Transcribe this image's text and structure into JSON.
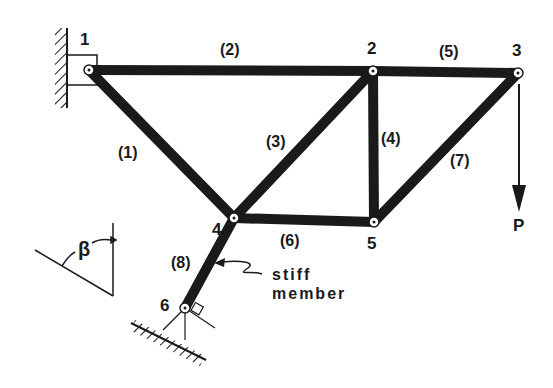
{
  "diagram": {
    "type": "plane truss",
    "colors": {
      "ink": "#1a1a1a",
      "background": "#ffffff"
    },
    "nodes": [
      {
        "id": "1",
        "label": "1",
        "x": 89,
        "y": 70
      },
      {
        "id": "2",
        "label": "2",
        "x": 373,
        "y": 71
      },
      {
        "id": "3",
        "label": "3",
        "x": 518,
        "y": 73
      },
      {
        "id": "4",
        "label": "4",
        "x": 234,
        "y": 218
      },
      {
        "id": "5",
        "label": "5",
        "x": 374,
        "y": 222
      },
      {
        "id": "6",
        "label": "6",
        "x": 185,
        "y": 308
      }
    ],
    "members": [
      {
        "label": "(1)",
        "from": "1",
        "to": "4"
      },
      {
        "label": "(2)",
        "from": "1",
        "to": "2"
      },
      {
        "label": "(3)",
        "from": "4",
        "to": "2"
      },
      {
        "label": "(4)",
        "from": "2",
        "to": "5"
      },
      {
        "label": "(5)",
        "from": "2",
        "to": "3"
      },
      {
        "label": "(6)",
        "from": "4",
        "to": "5"
      },
      {
        "label": "(7)",
        "from": "5",
        "to": "3"
      },
      {
        "label": "(8)",
        "from": "6",
        "to": "4"
      }
    ],
    "load": {
      "label": "P",
      "node": "3",
      "direction": "down"
    },
    "annotation": {
      "line1": "stiff",
      "line2": "member"
    },
    "angle": {
      "label": "β"
    }
  }
}
